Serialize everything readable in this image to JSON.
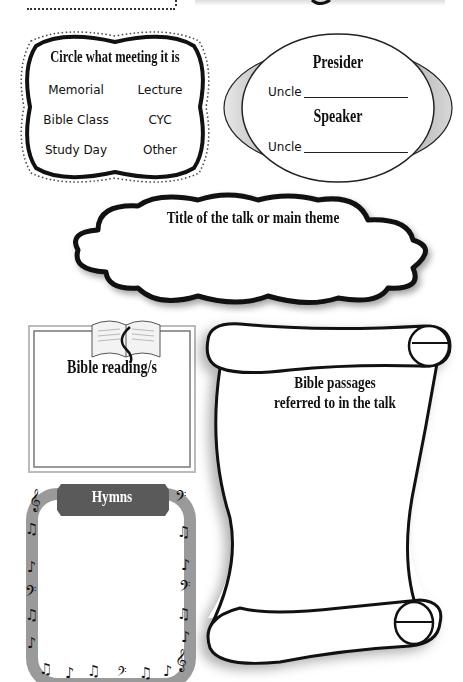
{
  "meeting": {
    "title": "Circle what meeting it is",
    "options": [
      "Memorial",
      "Lecture",
      "Bible Class",
      "CYC",
      "Study Day",
      "Other"
    ]
  },
  "roles": {
    "presider_label": "Presider",
    "speaker_label": "Speaker",
    "presider_prefix": "Uncle",
    "speaker_prefix": "Uncle"
  },
  "talk": {
    "title": "Title of the talk or main theme"
  },
  "reading": {
    "title": "Bible reading/s"
  },
  "passages": {
    "line1": "Bible passages",
    "line2": "referred to in the talk"
  },
  "hymns": {
    "title": "Hymns",
    "notes": {
      "treble": "𝄞",
      "bass": "𝄢",
      "eighth": "♪",
      "beamed": "♫"
    }
  },
  "colors": {
    "ink": "#111111",
    "hymn_frame": "#9a9a9a",
    "hymn_banner": "#5a5a5a",
    "oval_shade": "#8c8c8c"
  }
}
